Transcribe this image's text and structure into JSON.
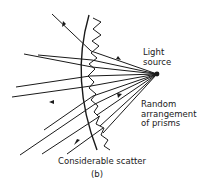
{
  "figure": {
    "labels": {
      "light_source": [
        "Light",
        "source"
      ],
      "prisms": [
        "Random",
        "arrangement",
        "of prisms"
      ],
      "caption": "Considerable scatter",
      "panel": "(b)"
    },
    "elements": [
      "lens-curve",
      "prism-zigzag-edge",
      "light-source-point",
      "light-rays"
    ],
    "line_color": "#1a1a1a"
  }
}
